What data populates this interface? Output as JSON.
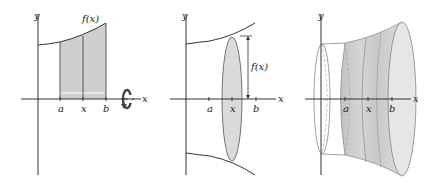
{
  "figure": {
    "colors": {
      "axis": "#333333",
      "fill_region": "#cfcfcf",
      "fill_disk": "#dadada",
      "fill_solid_dark": "#c4c4c4",
      "fill_solid_light": "#e6e6e6",
      "background": "#ffffff"
    },
    "panels": [
      {
        "id": "region",
        "labels": {
          "y_axis": "y",
          "x_axis": "x",
          "function": "f(x)",
          "a": "a",
          "x": "x",
          "b": "b"
        },
        "icons": [
          "rotation-arrow-icon"
        ]
      },
      {
        "id": "disk",
        "labels": {
          "y_axis": "y",
          "x_axis": "x",
          "function": "f(x)",
          "a": "a",
          "x": "x",
          "b": "b"
        }
      },
      {
        "id": "solid",
        "labels": {
          "y_axis": "y",
          "x_axis": "x",
          "a": "a",
          "x": "x",
          "b": "b"
        }
      }
    ]
  }
}
